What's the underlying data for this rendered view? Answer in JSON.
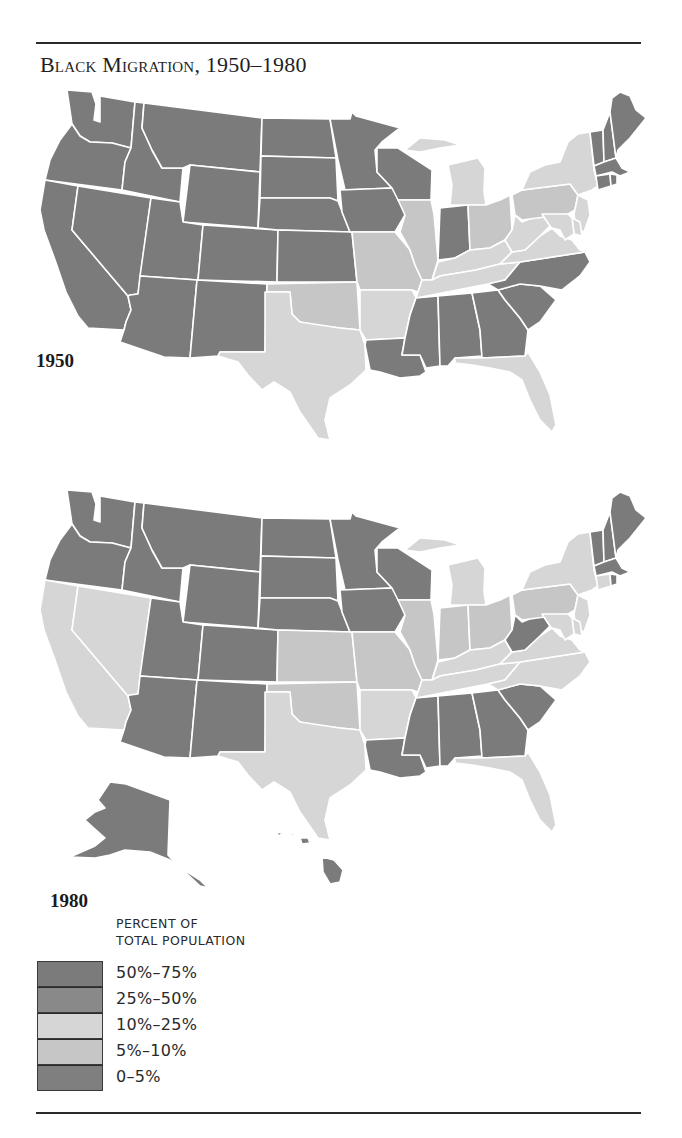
{
  "title": "Black Migration, 1950–1980",
  "colors": {
    "t50_75": "#7b7b7b",
    "t25_50": "#898989",
    "t10_25": "#d6d6d6",
    "t5_10": "#c6c6c6",
    "t0_5": "#7f7f7f"
  },
  "legend": {
    "title_line1": "PERCENT OF",
    "title_line2": "TOTAL POPULATION",
    "items": [
      {
        "label": "50%–75%",
        "key": "t50_75"
      },
      {
        "label": "25%–50%",
        "key": "t25_50"
      },
      {
        "label": "10%–25%",
        "key": "t10_25"
      },
      {
        "label": "5%–10%",
        "key": "t5_10"
      },
      {
        "label": "0–5%",
        "key": "t0_5"
      }
    ]
  },
  "maps": [
    {
      "year": "1950",
      "shading": {
        "WA": "dark",
        "OR": "dark",
        "CA": "dark",
        "ID": "dark",
        "NV": "dark",
        "MT": "dark",
        "WY": "dark",
        "UT": "dark",
        "CO": "dark",
        "AZ": "dark",
        "NM": "dark",
        "ND": "dark",
        "SD": "dark",
        "NE": "dark",
        "KS": "dark",
        "MN": "dark",
        "IA": "dark",
        "WI": "dark",
        "OK": "light",
        "TX": "light",
        "MO": "light",
        "AR": "light",
        "IL": "light",
        "IN": "dark",
        "MI": "light",
        "OH": "light",
        "KY": "light",
        "TN": "light",
        "LA": "dark",
        "MS": "dark",
        "AL": "dark",
        "GA": "dark",
        "FL": "light",
        "SC": "dark",
        "NC": "dark",
        "VA": "light",
        "WV": "light",
        "PA": "light",
        "NY": "light",
        "NJ": "light",
        "DE": "light",
        "MD": "light",
        "ME": "dark",
        "NH": "dark",
        "VT": "dark",
        "MA": "dark",
        "CT": "dark",
        "RI": "dark"
      }
    },
    {
      "year": "1980",
      "shading": {
        "WA": "dark",
        "OR": "dark",
        "CA": "light",
        "ID": "dark",
        "NV": "light",
        "MT": "dark",
        "WY": "dark",
        "UT": "dark",
        "CO": "dark",
        "AZ": "dark",
        "NM": "dark",
        "ND": "dark",
        "SD": "dark",
        "NE": "dark",
        "KS": "light",
        "MN": "dark",
        "IA": "dark",
        "WI": "dark",
        "OK": "light",
        "TX": "light",
        "MO": "light",
        "AR": "light",
        "IL": "light",
        "IN": "light",
        "MI": "light",
        "OH": "light",
        "KY": "light",
        "TN": "light",
        "LA": "dark",
        "MS": "dark",
        "AL": "dark",
        "GA": "dark",
        "FL": "light",
        "SC": "dark",
        "NC": "light",
        "VA": "light",
        "WV": "dark",
        "PA": "light",
        "NY": "light",
        "NJ": "light",
        "DE": "light",
        "MD": "light",
        "ME": "dark",
        "NH": "dark",
        "VT": "dark",
        "MA": "dark",
        "CT": "light",
        "RI": "dark",
        "AK": "dark",
        "HI": "dark"
      }
    }
  ],
  "chart_data": {
    "type": "choropleth",
    "title": "Black Migration, 1950–1980",
    "legend_title": "Percent of Total Population",
    "legend": [
      "50%–75%",
      "25%–50%",
      "10%–25%",
      "5%–10%",
      "0–5%"
    ],
    "note": "Printed in grayscale; states shown as dark (0–5% / 25–75% tones) or light (5–25% tones).",
    "maps": [
      {
        "year": "1950",
        "light_states": [
          "OK",
          "TX",
          "MO",
          "AR",
          "IL",
          "MI",
          "OH",
          "KY",
          "TN",
          "FL",
          "VA",
          "WV",
          "PA",
          "NY",
          "NJ",
          "DE",
          "MD"
        ],
        "dark_states": [
          "WA",
          "OR",
          "CA",
          "ID",
          "NV",
          "MT",
          "WY",
          "UT",
          "CO",
          "AZ",
          "NM",
          "ND",
          "SD",
          "NE",
          "KS",
          "MN",
          "IA",
          "WI",
          "IN",
          "LA",
          "MS",
          "AL",
          "GA",
          "SC",
          "NC",
          "ME",
          "NH",
          "VT",
          "MA",
          "CT",
          "RI"
        ]
      },
      {
        "year": "1980",
        "light_states": [
          "CA",
          "NV",
          "KS",
          "OK",
          "TX",
          "MO",
          "AR",
          "IL",
          "IN",
          "MI",
          "OH",
          "KY",
          "TN",
          "FL",
          "NC",
          "VA",
          "PA",
          "NY",
          "NJ",
          "DE",
          "MD",
          "CT"
        ],
        "dark_states": [
          "WA",
          "OR",
          "ID",
          "MT",
          "WY",
          "UT",
          "CO",
          "AZ",
          "NM",
          "ND",
          "SD",
          "NE",
          "MN",
          "IA",
          "WI",
          "LA",
          "MS",
          "AL",
          "GA",
          "SC",
          "WV",
          "ME",
          "NH",
          "VT",
          "MA",
          "RI",
          "AK",
          "HI"
        ]
      }
    ]
  }
}
